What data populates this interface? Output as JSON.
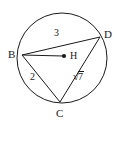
{
  "figure": {
    "type": "geometry-diagram",
    "stroke_color": "#1a1a1a",
    "background_color": "#ffffff",
    "circle": {
      "center_x": 62,
      "center_y": 58,
      "radius": 45,
      "center_point_name": "H"
    },
    "vertices": [
      {
        "name": "B",
        "label": "B",
        "x": 22,
        "y": 55,
        "label_x": 8,
        "label_y": 49
      },
      {
        "name": "D",
        "label": "D",
        "x": 100,
        "y": 37,
        "label_x": 104,
        "label_y": 29
      },
      {
        "name": "C",
        "label": "C",
        "x": 60,
        "y": 102,
        "label_x": 56,
        "label_y": 108
      },
      {
        "name": "H",
        "label": "H",
        "x": 64,
        "y": 56,
        "label_x": 70,
        "label_y": 50
      }
    ],
    "segments": [
      {
        "name": "segment-BD",
        "from": "B",
        "to": "D",
        "measure": "3"
      },
      {
        "name": "segment-BC",
        "from": "B",
        "to": "C",
        "measure": "2"
      },
      {
        "name": "segment-CD",
        "from": "C",
        "to": "D",
        "measure": "√7"
      },
      {
        "name": "segment-BH",
        "from": "B",
        "to": "H",
        "measure": ""
      }
    ],
    "measure_labels": [
      {
        "name": "label-BD",
        "text": "3",
        "x": 54,
        "y": 28
      },
      {
        "name": "label-BC",
        "text": "2",
        "x": 30,
        "y": 72
      },
      {
        "name": "label-CD",
        "text": "√7",
        "radicand": "7",
        "x": 73,
        "y": 71
      }
    ]
  }
}
